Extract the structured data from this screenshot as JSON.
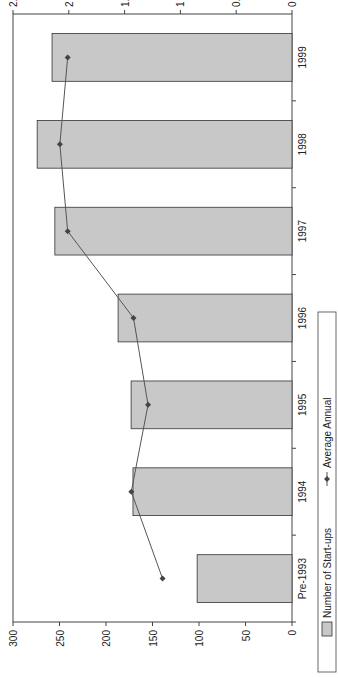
{
  "chart_data": {
    "type": "bar",
    "orientation": "rotated-90-clockwise",
    "title": "",
    "categories": [
      "Pre-1993",
      "1994",
      "1995",
      "1996",
      "1997",
      "1998",
      "1999"
    ],
    "series": [
      {
        "name": "Number of Start-ups",
        "type": "bar",
        "axis": "primary",
        "color": "#c8c8c8",
        "values": [
          102,
          171,
          173,
          187,
          255,
          274,
          258
        ]
      },
      {
        "name": "Average Annual",
        "type": "line",
        "axis": "secondary",
        "color": "#555555",
        "marker": "diamond",
        "values": [
          1.16,
          1.44,
          1.29,
          1.42,
          2.01,
          2.08,
          2.01
        ]
      }
    ],
    "primary_axis": {
      "label": "",
      "ylim": [
        0,
        300
      ],
      "ticks": [
        "0",
        "50",
        "100",
        "150",
        "200",
        "250",
        "300"
      ]
    },
    "secondary_axis": {
      "label": "",
      "ylim": [
        0,
        2.5
      ],
      "ticks": [
        "0",
        "0.5",
        "1",
        "1.5",
        "2",
        "2.5"
      ]
    },
    "grid": false,
    "legend": {
      "position": "bottom",
      "entries": [
        "Number of Start-ups",
        "Average Annual"
      ]
    }
  }
}
